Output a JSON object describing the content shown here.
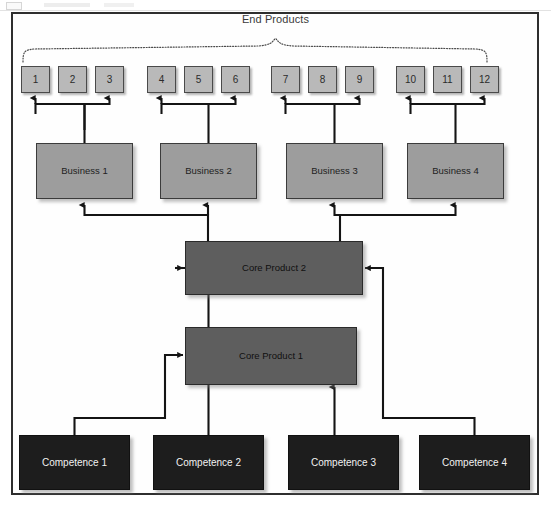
{
  "diagram": {
    "title": "End Products",
    "levels": {
      "end_products_label": "End Products",
      "end_products": [
        {
          "id": "ep1",
          "label": "1",
          "x": 21,
          "y": 66,
          "fed": true
        },
        {
          "id": "ep2",
          "label": "2",
          "x": 58,
          "y": 66,
          "fed": false
        },
        {
          "id": "ep3",
          "label": "3",
          "x": 95,
          "y": 66,
          "fed": true
        },
        {
          "id": "ep4",
          "label": "4",
          "x": 147,
          "y": 66,
          "fed": true
        },
        {
          "id": "ep5",
          "label": "5",
          "x": 184,
          "y": 66,
          "fed": false
        },
        {
          "id": "ep6",
          "label": "6",
          "x": 221,
          "y": 66,
          "fed": true
        },
        {
          "id": "ep7",
          "label": "7",
          "x": 271,
          "y": 66,
          "fed": true
        },
        {
          "id": "ep8",
          "label": "8",
          "x": 308,
          "y": 66,
          "fed": false
        },
        {
          "id": "ep9",
          "label": "9",
          "x": 345,
          "y": 66,
          "fed": true
        },
        {
          "id": "ep10",
          "label": "10",
          "x": 396,
          "y": 66,
          "fed": true
        },
        {
          "id": "ep11",
          "label": "11",
          "x": 433,
          "y": 66,
          "fed": false
        },
        {
          "id": "ep12",
          "label": "12",
          "x": 470,
          "y": 66,
          "fed": true
        }
      ],
      "businesses": [
        {
          "id": "b1",
          "label": "Business 1",
          "x": 36,
          "y": 143
        },
        {
          "id": "b2",
          "label": "Business 2",
          "x": 160,
          "y": 143
        },
        {
          "id": "b3",
          "label": "Business 3",
          "x": 286,
          "y": 143
        },
        {
          "id": "b4",
          "label": "Business 4",
          "x": 407,
          "y": 143
        }
      ],
      "core_products": [
        {
          "id": "cp2",
          "label": "Core Product 2",
          "x": 185,
          "y": 241,
          "w": 178,
          "h": 54
        },
        {
          "id": "cp1",
          "label": "Core Product 1",
          "x": 185,
          "y": 327,
          "w": 172,
          "h": 58
        }
      ],
      "competences": [
        {
          "id": "c1",
          "label": "Competence 1",
          "x": 19,
          "y": 435
        },
        {
          "id": "c2",
          "label": "Competence 2",
          "x": 153,
          "y": 435
        },
        {
          "id": "c3",
          "label": "Competence 3",
          "x": 288,
          "y": 435
        },
        {
          "id": "c4",
          "label": "Competence 4",
          "x": 419,
          "y": 435
        }
      ]
    },
    "colors": {
      "end_product_fill": "#b9b9b9",
      "business_fill": "#9d9d9d",
      "core_product_fill": "#5e5e5e",
      "competence_fill": "#1d1d1d",
      "frame_stroke": "#2e2e2e",
      "connector_stroke": "#141414",
      "brace_stroke": "#4a4a4a"
    }
  }
}
